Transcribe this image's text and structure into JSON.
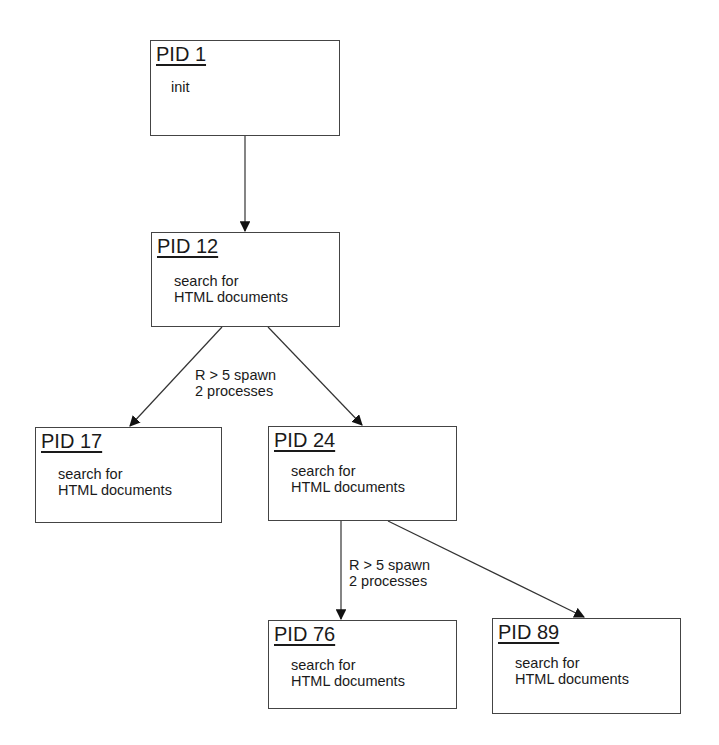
{
  "diagram": {
    "type": "process-tree",
    "nodes": [
      {
        "id": "pid1",
        "pid": "PID 1",
        "desc": "init",
        "x": 150,
        "y": 40,
        "w": 190,
        "h": 96
      },
      {
        "id": "pid12",
        "pid": "PID 12",
        "desc": "search for\nHTML documents",
        "x": 151,
        "y": 232,
        "w": 189,
        "h": 95
      },
      {
        "id": "pid17",
        "pid": "PID 17",
        "desc": "search for\nHTML documents",
        "x": 35,
        "y": 427,
        "w": 187,
        "h": 96
      },
      {
        "id": "pid24",
        "pid": "PID 24",
        "desc": "search for\nHTML documents",
        "x": 268,
        "y": 426,
        "w": 189,
        "h": 95
      },
      {
        "id": "pid76",
        "pid": "PID 76",
        "desc": "search for\nHTML documents",
        "x": 268,
        "y": 620,
        "w": 189,
        "h": 89
      },
      {
        "id": "pid89",
        "pid": "PID 89",
        "desc": "search for\nHTML documents",
        "x": 492,
        "y": 618,
        "w": 189,
        "h": 96
      }
    ],
    "edges": [
      {
        "from": "pid1",
        "to": "pid12"
      },
      {
        "from": "pid12",
        "to": "pid17"
      },
      {
        "from": "pid12",
        "to": "pid24"
      },
      {
        "from": "pid24",
        "to": "pid76"
      },
      {
        "from": "pid24",
        "to": "pid89"
      }
    ],
    "labels": [
      {
        "text": "R > 5 spawn\n2 processes",
        "x": 195,
        "y": 367
      },
      {
        "text": "R > 5 spawn\n2 processes",
        "x": 349,
        "y": 557
      }
    ]
  }
}
